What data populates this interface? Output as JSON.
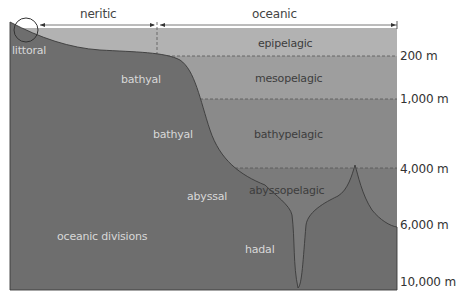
{
  "diagram": {
    "title": "oceanic divisions",
    "zones_top": {
      "neritic": "neritic",
      "oceanic": "oceanic"
    },
    "pelagic_zones": [
      {
        "label": "epipelagic",
        "depth_end": "200 m"
      },
      {
        "label": "mesopelagic",
        "depth_end": "1,000 m"
      },
      {
        "label": "bathypelagic",
        "depth_end": "4,000 m"
      },
      {
        "label": "abyssopelagic",
        "depth_end": "6,000 m"
      },
      {
        "label": "hadal",
        "depth_end": "10,000 m"
      }
    ],
    "benthic_zones": {
      "littoral": "littoral",
      "bathyal_upper": "bathyal",
      "bathyal_lower": "bathyal",
      "abyssal": "abyssal",
      "hadal": "hadal"
    },
    "depth_labels": [
      "200 m",
      "1,000 m",
      "4,000 m",
      "6,000 m",
      "10,000 m"
    ],
    "colors": {
      "seafloor": "#6e6e6e",
      "epipelagic": "#b2b2b2",
      "mesopelagic": "#9e9e9e",
      "bathypelagic": "#8a8a8a",
      "abyssopelagic": "#7a7a7a"
    }
  }
}
